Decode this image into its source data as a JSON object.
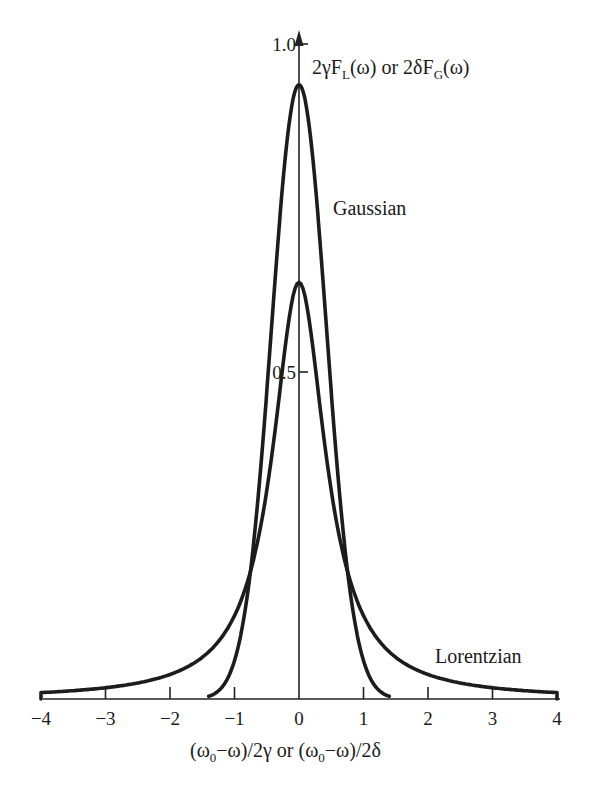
{
  "chart_data": {
    "type": "line",
    "title": "",
    "xlabel": "(ω0−ω)/2γ or (ω0−ω)/2δ",
    "xlabel_parts": {
      "open1": "(ω",
      "sub1": "0",
      "mid1": "−ω)/2γ or (ω",
      "sub2": "0",
      "mid2": "−ω)/2δ"
    },
    "ylabel": "2γF_L(ω) or 2δF_G(ω)",
    "ylabel_parts": {
      "a": "2γF",
      "a_sub": "L",
      "b": "(ω) or 2δF",
      "b_sub": "G",
      "c": "(ω)"
    },
    "xlim": [
      -4,
      4
    ],
    "ylim": [
      0,
      1.0
    ],
    "grid": false,
    "legend": "inline labels",
    "x_ticks": [
      -4,
      -3,
      -2,
      -1,
      0,
      1,
      2,
      3,
      4
    ],
    "x_tick_labels": [
      "−4",
      "−3",
      "−2",
      "−1",
      "0",
      "1",
      "2",
      "3",
      "4"
    ],
    "y_ticks": [
      0.5,
      1.0
    ],
    "y_tick_labels": [
      "0.5",
      "1.0"
    ],
    "series": [
      {
        "name": "Gaussian",
        "peak": 0.94,
        "x": [
          -1.4,
          -1.2,
          -1.0,
          -0.8,
          -0.6,
          -0.4,
          -0.2,
          0,
          0.2,
          0.4,
          0.6,
          0.8,
          1.0,
          1.2,
          1.4
        ],
        "values": [
          0.004,
          0.017,
          0.059,
          0.16,
          0.347,
          0.605,
          0.843,
          0.939,
          0.843,
          0.605,
          0.347,
          0.16,
          0.059,
          0.017,
          0.004
        ]
      },
      {
        "name": "Lorentzian",
        "peak": 0.64,
        "x": [
          -4,
          -3,
          -2,
          -1.5,
          -1,
          -0.75,
          -0.5,
          -0.25,
          0,
          0.25,
          0.5,
          0.75,
          1,
          1.5,
          2,
          3,
          4
        ],
        "values": [
          0.01,
          0.017,
          0.039,
          0.064,
          0.127,
          0.196,
          0.318,
          0.509,
          0.637,
          0.509,
          0.318,
          0.196,
          0.127,
          0.064,
          0.039,
          0.017,
          0.01
        ]
      }
    ],
    "annotations": [
      {
        "text": "Gaussian",
        "x": 0.55,
        "y": 0.74
      },
      {
        "text": "Lorentzian",
        "x": 2.1,
        "y": 0.07
      }
    ]
  }
}
